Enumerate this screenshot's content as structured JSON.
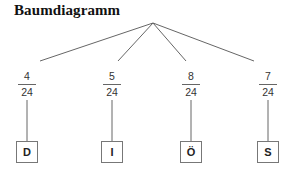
{
  "title": "Baumdiagramm",
  "tree": {
    "root": {
      "x": 153,
      "y": 23
    },
    "branch_end_y": 61,
    "stem_top_y": 100,
    "stem_bottom_y": 141,
    "line_color": "#666666",
    "branches": [
      {
        "x": 27,
        "numerator": "4",
        "denominator": "24",
        "outcome": "D"
      },
      {
        "x": 112,
        "numerator": "5",
        "denominator": "24",
        "outcome": "I"
      },
      {
        "x": 191,
        "numerator": "8",
        "denominator": "24",
        "outcome": "Ö"
      },
      {
        "x": 268,
        "numerator": "7",
        "denominator": "24",
        "outcome": "S"
      }
    ]
  }
}
